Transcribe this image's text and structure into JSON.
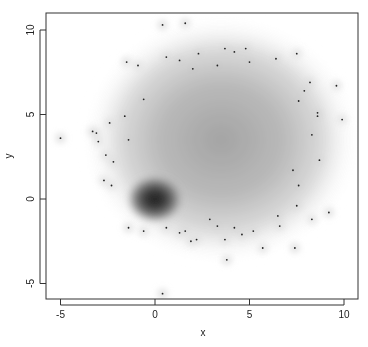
{
  "chart_data": {
    "type": "heatmap",
    "subtype": "smoothed scatter density",
    "title": "",
    "xlabel": "x",
    "ylabel": "y",
    "xlim": [
      -6.5,
      10.9
    ],
    "ylim": [
      -5.9,
      11.0
    ],
    "xticks": [
      -5,
      0,
      5,
      10
    ],
    "yticks": [
      -5,
      0,
      5,
      10
    ],
    "xtick_labels": [
      "-5",
      "0",
      "5",
      "10"
    ],
    "ytick_labels": [
      "-5",
      "0",
      "5",
      "10"
    ],
    "grid": false,
    "legend": null,
    "density_components": [
      {
        "name": "dense cluster",
        "center": [
          0,
          0
        ],
        "sd": [
          0.9,
          0.85
        ],
        "relative_peak": 1.0
      },
      {
        "name": "diffuse cloud",
        "center": [
          3.5,
          3.5
        ],
        "sd": [
          2.8,
          2.8
        ],
        "relative_peak": 0.45
      }
    ],
    "outlier_points": [
      [
        -5.0,
        3.6
      ],
      [
        -3.3,
        4.0
      ],
      [
        -3.0,
        3.4
      ],
      [
        -3.1,
        3.9
      ],
      [
        -2.6,
        2.6
      ],
      [
        -2.4,
        4.5
      ],
      [
        -2.2,
        2.2
      ],
      [
        -2.7,
        1.1
      ],
      [
        -2.3,
        0.8
      ],
      [
        -1.4,
        3.5
      ],
      [
        -1.6,
        4.9
      ],
      [
        -0.9,
        7.9
      ],
      [
        -0.6,
        5.9
      ],
      [
        -1.5,
        8.1
      ],
      [
        0.4,
        10.3
      ],
      [
        1.6,
        10.4
      ],
      [
        0.6,
        8.4
      ],
      [
        2.0,
        7.7
      ],
      [
        2.3,
        8.6
      ],
      [
        1.3,
        8.2
      ],
      [
        3.3,
        7.9
      ],
      [
        3.7,
        8.9
      ],
      [
        4.2,
        8.7
      ],
      [
        4.8,
        8.9
      ],
      [
        5.0,
        8.1
      ],
      [
        6.4,
        8.3
      ],
      [
        7.5,
        8.6
      ],
      [
        8.2,
        6.9
      ],
      [
        7.9,
        6.4
      ],
      [
        7.6,
        5.8
      ],
      [
        8.6,
        5.1
      ],
      [
        9.6,
        6.7
      ],
      [
        9.9,
        4.7
      ],
      [
        8.6,
        4.9
      ],
      [
        8.3,
        3.8
      ],
      [
        8.7,
        2.3
      ],
      [
        7.3,
        1.7
      ],
      [
        7.6,
        0.8
      ],
      [
        8.3,
        -1.2
      ],
      [
        7.5,
        -0.4
      ],
      [
        6.6,
        -1.6
      ],
      [
        7.4,
        -2.9
      ],
      [
        6.5,
        -1.0
      ],
      [
        5.7,
        -2.9
      ],
      [
        4.6,
        -2.1
      ],
      [
        4.2,
        -1.7
      ],
      [
        3.3,
        -1.6
      ],
      [
        2.9,
        -1.2
      ],
      [
        3.7,
        -2.4
      ],
      [
        5.2,
        -1.9
      ],
      [
        1.3,
        -2.0
      ],
      [
        1.6,
        -1.9
      ],
      [
        1.9,
        -2.5
      ],
      [
        2.2,
        -2.4
      ],
      [
        0.6,
        -1.7
      ],
      [
        -1.4,
        -1.7
      ],
      [
        -0.6,
        -1.9
      ],
      [
        0.4,
        -5.6
      ],
      [
        9.2,
        -0.8
      ],
      [
        3.8,
        -3.6
      ]
    ]
  },
  "axes": {
    "x_title": "x",
    "y_title": "y"
  }
}
